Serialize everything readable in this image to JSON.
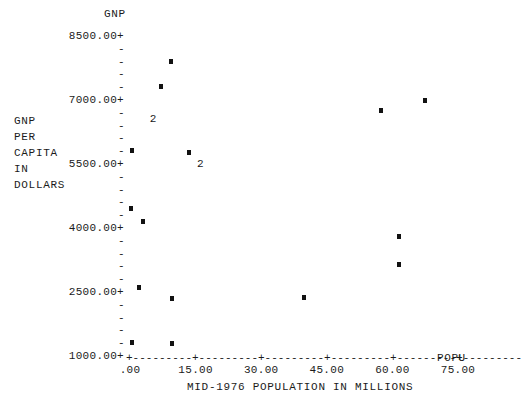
{
  "chart_data": {
    "type": "scatter",
    "title": "",
    "xlabel": "MID-1976 POPULATION IN MILLIONS",
    "ylabel": "GNP PER CAPITA IN DOLLARS",
    "y_axis_name": "GNP",
    "x_axis_name": "POPU",
    "xlim": [
      0,
      78
    ],
    "ylim": [
      1000,
      8500
    ],
    "grid": false,
    "legend": "none",
    "x_ticks": [
      ".00",
      "15.00",
      "30.00",
      "45.00",
      "60.00",
      "75.00"
    ],
    "x_tick_values": [
      0,
      15,
      30,
      45,
      60,
      75
    ],
    "y_ticks": [
      "8500.00+",
      "7000.00+",
      "5500.00+",
      "4000.00+",
      "2500.00+",
      "1000.00+"
    ],
    "y_tick_values": [
      8500,
      7000,
      5500,
      4000,
      2500,
      1000
    ],
    "y_minor_ticks_between": 4,
    "y_minor_tick_glyph": "-",
    "point_glyph": "*",
    "overlap_glyph": "2",
    "points": [
      {
        "x": 9.3,
        "y": 7930,
        "n": 1,
        "label": "*"
      },
      {
        "x": 7.0,
        "y": 7340,
        "n": 1,
        "label": "*"
      },
      {
        "x": 5.2,
        "y": 6560,
        "n": 2,
        "label": "2"
      },
      {
        "x": 0.4,
        "y": 5840,
        "n": 1,
        "label": "*"
      },
      {
        "x": 13.5,
        "y": 5800,
        "n": 1,
        "label": "*"
      },
      {
        "x": 16.0,
        "y": 5490,
        "n": 2,
        "label": "2"
      },
      {
        "x": 0.3,
        "y": 4490,
        "n": 1,
        "label": "*"
      },
      {
        "x": 3.0,
        "y": 4190,
        "n": 1,
        "label": "*"
      },
      {
        "x": 2.0,
        "y": 2640,
        "n": 1,
        "label": "*"
      },
      {
        "x": 9.6,
        "y": 2380,
        "n": 1,
        "label": "*"
      },
      {
        "x": 39.8,
        "y": 2410,
        "n": 1,
        "label": "*"
      },
      {
        "x": 0.4,
        "y": 1350,
        "n": 1,
        "label": "*"
      },
      {
        "x": 9.7,
        "y": 1320,
        "n": 1,
        "label": "*"
      },
      {
        "x": 61.5,
        "y": 3830,
        "n": 1,
        "label": "*"
      },
      {
        "x": 61.5,
        "y": 3190,
        "n": 1,
        "label": "*"
      },
      {
        "x": 57.5,
        "y": 6790,
        "n": 1,
        "label": "*"
      },
      {
        "x": 67.5,
        "y": 7020,
        "n": 1,
        "label": "*"
      }
    ]
  },
  "yaxis": {
    "name": "GNP",
    "caption_lines": [
      "GNP",
      "PER",
      "CAPITA",
      "IN",
      "DOLLARS"
    ],
    "labels": [
      "8500.00+",
      "7000.00+",
      "5500.00+",
      "4000.00+",
      "2500.00+",
      "1000.00+"
    ],
    "minor_tick": "-"
  },
  "xaxis": {
    "name": "POPU",
    "caption": "MID-1976 POPULATION IN MILLIONS",
    "labels": [
      ".00",
      "15.00",
      "30.00",
      "45.00",
      "60.00",
      "75.00"
    ],
    "line": "+---------+---------+---------+---------+---------+---------"
  },
  "colors": {
    "ink": "#1b1b1b",
    "marker": "#121212",
    "background": "#ffffff"
  }
}
